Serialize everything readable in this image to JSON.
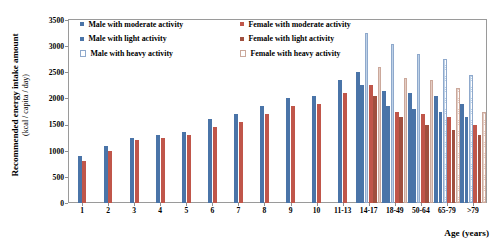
{
  "chart_data": {
    "type": "bar",
    "title": "",
    "xlabel": "Age (years)",
    "ylabel": "Recommended energy intake amount",
    "ylabel_units": "(kcal / capita / day)",
    "ylim": [
      0,
      3500
    ],
    "ytick_step": 500,
    "yticks": [
      "0",
      "500",
      "1000",
      "1500",
      "2000",
      "2500",
      "3000",
      "3500"
    ],
    "grid": false,
    "legend_position": "top-left-inside",
    "categories": [
      "1",
      "2",
      "3",
      "4",
      "5",
      "6",
      "7",
      "8",
      "9",
      "10",
      "11-13",
      "14-17",
      "18-49",
      "50-64",
      "65-79",
      ">79"
    ],
    "series": [
      {
        "name": "Male with moderate activity",
        "color": "#4a74a8",
        "values": [
          900,
          1100,
          1250,
          1300,
          1350,
          1600,
          1700,
          1850,
          2000,
          2050,
          2350,
          2500,
          2150,
          2100,
          2050,
          1900
        ]
      },
      {
        "name": "Female with moderate activity",
        "color": "#c0564a",
        "values": [
          800,
          1000,
          1200,
          1250,
          1300,
          1450,
          1550,
          1700,
          1850,
          1900,
          2100,
          2250,
          1750,
          1700,
          1650,
          1500
        ]
      },
      {
        "name": "Male with light activity",
        "color": "#4a74a8",
        "values": [
          null,
          null,
          null,
          null,
          null,
          null,
          null,
          null,
          null,
          null,
          null,
          2250,
          1850,
          1800,
          1750,
          1650
        ]
      },
      {
        "name": "Female with light activity",
        "color": "#a0503f",
        "values": [
          null,
          null,
          null,
          null,
          null,
          null,
          null,
          null,
          null,
          null,
          null,
          2050,
          1650,
          1500,
          1400,
          1300
        ]
      },
      {
        "name": "Male with heavy activity",
        "color": "#8fa9cc",
        "values": [
          null,
          null,
          null,
          null,
          null,
          null,
          null,
          null,
          null,
          null,
          null,
          3250,
          3050,
          2850,
          2750,
          2450
        ]
      },
      {
        "name": "Female with heavy activity",
        "color": "#cba89b",
        "values": [
          null,
          null,
          null,
          null,
          null,
          null,
          null,
          null,
          null,
          null,
          null,
          2600,
          2400,
          2350,
          2200,
          1750
        ]
      }
    ]
  },
  "legend": {
    "items": [
      {
        "label": "Male with moderate activity",
        "key": "m-mod"
      },
      {
        "label": "Female with moderate activity",
        "key": "f-mod"
      },
      {
        "label": "Male with light activity",
        "key": "m-light"
      },
      {
        "label": "Female with light activity",
        "key": "f-light"
      },
      {
        "label": "Male with heavy activity",
        "key": "m-heavy"
      },
      {
        "label": "Female with heavy activity",
        "key": "f-heavy"
      }
    ]
  }
}
